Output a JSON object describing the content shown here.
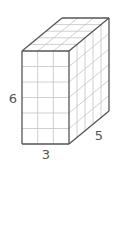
{
  "diagram": {
    "type": "rectangular-prism-unit-cubes",
    "dimensions": {
      "width": 3,
      "depth": 5,
      "height": 6
    },
    "labels": {
      "height": "6",
      "width": "3",
      "depth": "5"
    },
    "colors": {
      "outline": "#555555",
      "grid": "#c4c4c4",
      "label": "#555555",
      "background": "#ffffff"
    }
  }
}
